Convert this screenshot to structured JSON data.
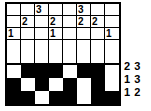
{
  "puzzle": {
    "type": "nonogram",
    "columns": 8,
    "clue_rows": 3,
    "blank_rows": 1,
    "solution_rows": 3,
    "column_clues": [
      [
        "",
        "",
        "3",
        "",
        "",
        "3",
        "",
        ""
      ],
      [
        "",
        "2",
        "",
        "2",
        "",
        "2",
        "2",
        ""
      ],
      [
        "1",
        "",
        "",
        "1",
        "",
        "",
        "",
        "1"
      ]
    ],
    "blank_row": [
      "",
      "",
      "",
      "",
      "",
      "",
      "",
      ""
    ],
    "solution": [
      [
        "white",
        "black",
        "black",
        "black",
        "white",
        "black",
        "black",
        "white"
      ],
      [
        "black",
        "white",
        "black",
        "white",
        "black",
        "white",
        "black",
        "white"
      ],
      [
        "black",
        "black",
        "white",
        "black",
        "black",
        "white",
        "black",
        "black"
      ]
    ],
    "row_clues": [
      [
        "2",
        "3"
      ],
      [
        "1",
        "3"
      ],
      [
        "1",
        "2"
      ]
    ],
    "colors": {
      "filled": "#000000",
      "empty": "#ffffff",
      "border": "#000000",
      "text": "#000000"
    }
  }
}
